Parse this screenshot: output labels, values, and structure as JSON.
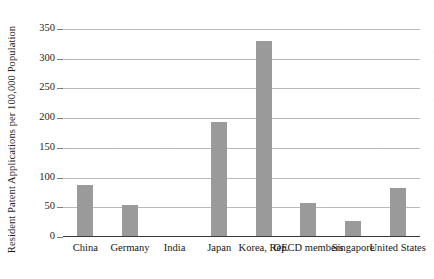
{
  "chart_data": {
    "type": "bar",
    "title": "",
    "subtitle": "",
    "xlabel": "",
    "ylabel": "Resident Patent Applications per 100,000 Population",
    "categories": [
      "China",
      "Germany",
      "India",
      "Japan",
      "Korea, Rep.",
      "OECD members",
      "Singapore",
      "United States"
    ],
    "values": [
      88,
      54,
      1,
      193,
      330,
      58,
      27,
      82
    ],
    "ylim": [
      0,
      350
    ],
    "yticks": [
      0,
      50,
      100,
      150,
      200,
      250,
      300,
      350
    ],
    "ytick_labels": [
      "0",
      "50",
      "100",
      "150",
      "200",
      "250",
      "300",
      "350"
    ],
    "grid": true,
    "legend": false,
    "legend_position": "none",
    "bar_color": "#9a9a9a",
    "gridline_color": "#b9b9b9",
    "axis_color": "#3a3a3a",
    "background_color": "#ffffff"
  }
}
